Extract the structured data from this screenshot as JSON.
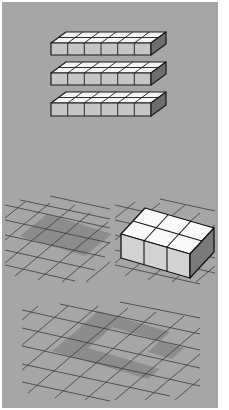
{
  "figure": {
    "background_color": "#a6a6a6",
    "page_color": "#ffffff",
    "top": {
      "description": "three stacked flat layers of 2x6 unit cubes",
      "layers": 3,
      "rows_per_layer": 2,
      "cubes_per_row": 6
    },
    "middle_left": {
      "description": "isometric grid with a 2x3 shaded region",
      "shaded_cols": 3,
      "shaded_rows": 2,
      "shade_color": "#8a8a8a"
    },
    "middle_right": {
      "description": "2x3 block of unit cubes standing on isometric grid",
      "cubes_cols": 3,
      "cubes_rows": 2
    },
    "bottom": {
      "description": "isometric grid with a shaded cross/X-shaped pattern",
      "shade_color": "#8a8a8a"
    }
  }
}
